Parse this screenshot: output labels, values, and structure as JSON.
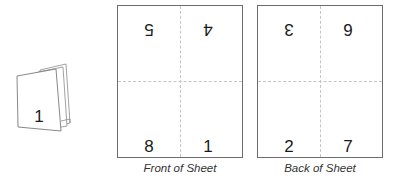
{
  "booklet": {
    "cover_page_number": "1"
  },
  "sheets": [
    {
      "caption": "Front of Sheet",
      "top_left": "5",
      "top_right": "4",
      "bottom_left": "8",
      "bottom_right": "1",
      "top_row_upside_down": true
    },
    {
      "caption": "Back of Sheet",
      "top_left": "3",
      "top_right": "6",
      "bottom_left": "2",
      "bottom_right": "7",
      "top_row_upside_down": true
    }
  ],
  "colors": {
    "border": "#6d6d6d",
    "fold_line": "#c4c4c4",
    "text": "#1a1a1a"
  }
}
